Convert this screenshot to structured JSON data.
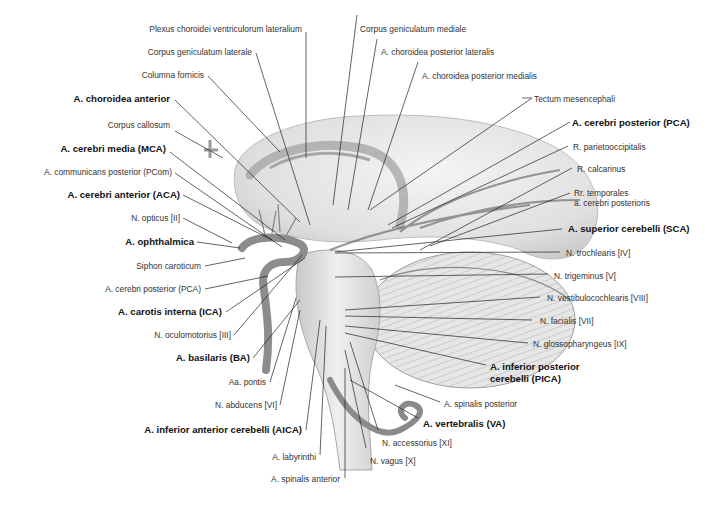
{
  "figure": {
    "colors": {
      "background": "#ffffff",
      "line": "#222222",
      "text": "#333333",
      "bold_text": "#111111",
      "illustration_gray": "#bdbdbd"
    }
  },
  "labels": {
    "top": [
      {
        "id": "plexus",
        "text": "Plexus choroidei ventriculorum lateralium",
        "bold": false
      },
      {
        "id": "cgm",
        "text": "Corpus geniculatum mediale",
        "bold": false
      },
      {
        "id": "cgl",
        "text": "Corpus geniculatum laterale",
        "bold": false
      },
      {
        "id": "acpl",
        "text": "A. choroidea posterior lateralis",
        "bold": false
      },
      {
        "id": "colfor",
        "text": "Columna fornicis",
        "bold": false
      },
      {
        "id": "acpm",
        "text": "A. choroidea posterior medialis",
        "bold": false
      }
    ],
    "left": [
      {
        "id": "aca_ch",
        "text": "A. choroidea anterior",
        "bold": true
      },
      {
        "id": "callos",
        "text": "Corpus callosum",
        "bold": false
      },
      {
        "id": "mca",
        "text": "A. cerebri media (MCA)",
        "bold": true
      },
      {
        "id": "pcom",
        "text": "A. communicans posterior (PCom)",
        "bold": false
      },
      {
        "id": "aca",
        "text": "A. cerebri anterior (ACA)",
        "bold": true
      },
      {
        "id": "opt",
        "text": "N. opticus [II]",
        "bold": false
      },
      {
        "id": "ophth",
        "text": "A. ophthalmica",
        "bold": true
      },
      {
        "id": "siphon",
        "text": "Siphon caroticum",
        "bold": false
      },
      {
        "id": "pca_l",
        "text": "A. cerebri posterior (PCA)",
        "bold": false
      },
      {
        "id": "ica",
        "text": "A. carotis interna (ICA)",
        "bold": true
      },
      {
        "id": "ocm",
        "text": "N. oculomotorius [III]",
        "bold": false
      },
      {
        "id": "ba",
        "text": "A. basilaris (BA)",
        "bold": true
      },
      {
        "id": "pontis",
        "text": "Aa. pontis",
        "bold": false
      },
      {
        "id": "abd",
        "text": "N. abducens [VI]",
        "bold": false
      },
      {
        "id": "aica",
        "text": "A. inferior anterior cerebelli (AICA)",
        "bold": true
      }
    ],
    "bottom": [
      {
        "id": "lab",
        "text": "A. labyrinthi",
        "bold": false
      },
      {
        "id": "spant",
        "text": "A. spinalis anterior",
        "bold": false
      },
      {
        "id": "vagus",
        "text": "N. vagus [X]",
        "bold": false
      },
      {
        "id": "access",
        "text": "N. accessorius [XI]",
        "bold": false
      }
    ],
    "right": [
      {
        "id": "tectum",
        "text": "Tectum mesencephali",
        "bold": false
      },
      {
        "id": "pca_r",
        "text": "A. cerebri posterior (PCA)",
        "bold": true
      },
      {
        "id": "parocc",
        "text": "R. parietooccipitalis",
        "bold": false
      },
      {
        "id": "calc",
        "text": "R. calcarinus",
        "bold": false
      },
      {
        "id": "rrtemp1",
        "text": "Rr. temporales",
        "bold": false
      },
      {
        "id": "rrtemp2",
        "text": "a. cerebri posterioris",
        "bold": false
      },
      {
        "id": "sca",
        "text": "A. superior cerebelli (SCA)",
        "bold": true
      },
      {
        "id": "troch",
        "text": "N. trochlearis [IV]",
        "bold": false
      },
      {
        "id": "trig",
        "text": "N. trigeminus [V]",
        "bold": false
      },
      {
        "id": "vest",
        "text": "N. vestibulocochlearis [VIII]",
        "bold": false
      },
      {
        "id": "fac",
        "text": "N. facialis [VII]",
        "bold": false
      },
      {
        "id": "gloss",
        "text": "N. glossopharyngeus [IX]",
        "bold": false
      },
      {
        "id": "pica1",
        "text": "A. inferior posterior",
        "bold": true
      },
      {
        "id": "pica2",
        "text": "cerebelli (PICA)",
        "bold": true
      },
      {
        "id": "spinpost",
        "text": "A. spinalis posterior",
        "bold": false
      },
      {
        "id": "va",
        "text": "A. vertebralis (VA)",
        "bold": true
      }
    ]
  }
}
